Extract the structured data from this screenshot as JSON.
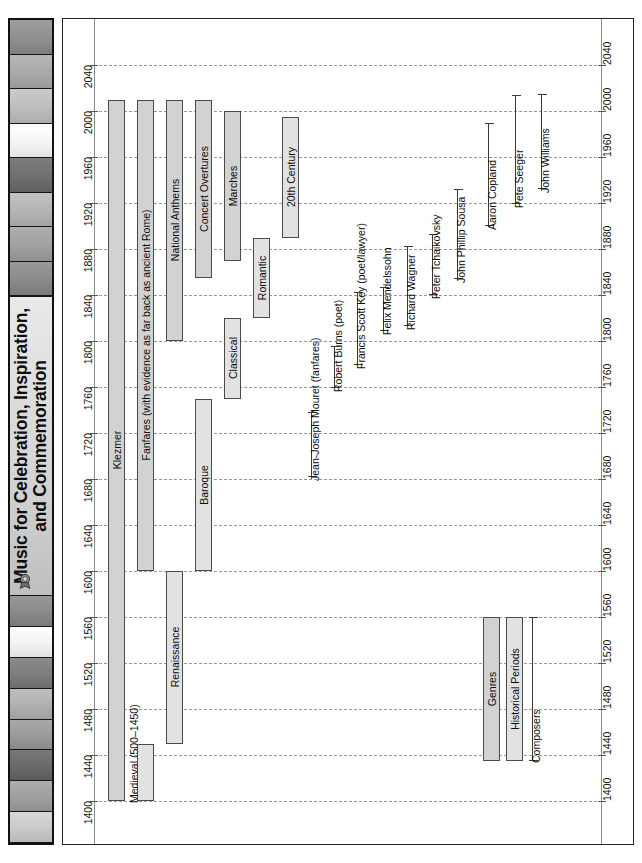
{
  "title": {
    "line1": "Music for Celebration, Inspiration,",
    "line2": "and Commemoration",
    "badge_icon": "ribbon-seal-icon"
  },
  "sidebar": {
    "swatches": [
      {
        "name": "swatch-1"
      },
      {
        "name": "swatch-2"
      },
      {
        "name": "swatch-3"
      },
      {
        "name": "swatch-4"
      },
      {
        "name": "swatch-5"
      },
      {
        "name": "swatch-6"
      },
      {
        "name": "swatch-7"
      },
      {
        "name": "swatch-8"
      },
      {
        "name": "swatch-9"
      },
      {
        "name": "swatch-10"
      },
      {
        "name": "swatch-11"
      },
      {
        "name": "swatch-12"
      },
      {
        "name": "swatch-13"
      },
      {
        "name": "swatch-14"
      },
      {
        "name": "swatch-15"
      },
      {
        "name": "swatch-16"
      }
    ]
  },
  "colors": {
    "genre_fill": "#d2d2d2",
    "period_fill": "#e2e2e2",
    "bar_stroke": "#4a4a4a",
    "gridline": "#9a9a9a",
    "axis": "#8c8c8c",
    "frame": "#222222",
    "text": "#0d0d0d"
  },
  "chart_data": {
    "type": "bar",
    "orientation": "vertical-timeline",
    "title": "Music for Celebration, Inspiration, and Commemoration",
    "xlabel": "",
    "ylabel": "",
    "ylim": [
      1400,
      2040
    ],
    "ytick_step": 40,
    "grid": true,
    "tick_labels": [
      "1400",
      "1440",
      "1480",
      "1520",
      "1560",
      "1600",
      "1640",
      "1680",
      "1720",
      "1760",
      "1800",
      "1840",
      "1880",
      "1920",
      "1960",
      "2000",
      "2040"
    ],
    "legend": {
      "position": "bottom-right-inside",
      "entries": [
        {
          "label": "Genres",
          "kind": "bar",
          "color": "#d2d2d2"
        },
        {
          "label": "Historical Periods",
          "kind": "bar",
          "color": "#e2e2e2"
        },
        {
          "label": "Composers",
          "kind": "range-line",
          "color": "#3a3a3a"
        }
      ]
    },
    "series": [
      {
        "name": "Genres",
        "kind": "bar",
        "style": "genre",
        "items": [
          {
            "label": "Klezmer",
            "start": 1400,
            "end": 2010
          },
          {
            "label": "Fanfares (with evidence as far back as ancient Rome)",
            "start": 1600,
            "end": 2010
          },
          {
            "label": "National Anthems",
            "start": 1800,
            "end": 2010
          },
          {
            "label": "Concert Overtures",
            "start": 1855,
            "end": 2010
          },
          {
            "label": "Marches",
            "start": 1870,
            "end": 2000
          }
        ]
      },
      {
        "name": "Historical Periods",
        "kind": "bar",
        "style": "period",
        "items": [
          {
            "label": "Medieval (500–1450)",
            "start": 1400,
            "end": 1450
          },
          {
            "label": "Renaissance",
            "start": 1450,
            "end": 1600
          },
          {
            "label": "Baroque",
            "start": 1600,
            "end": 1750
          },
          {
            "label": "Classical",
            "start": 1750,
            "end": 1820
          },
          {
            "label": "Romantic",
            "start": 1820,
            "end": 1890
          },
          {
            "label": "20th Century",
            "start": 1890,
            "end": 1995
          }
        ]
      },
      {
        "name": "Composers",
        "kind": "range-line",
        "items": [
          {
            "label": "Jean-Joseph Mouret (fanfares)",
            "start": 1682,
            "end": 1738
          },
          {
            "label": "Robert Burns (poet)",
            "start": 1759,
            "end": 1796
          },
          {
            "label": "Francis Scott Key (poet/lawyer)",
            "start": 1779,
            "end": 1843
          },
          {
            "label": "Felix Mendelssohn",
            "start": 1809,
            "end": 1847
          },
          {
            "label": "Richard Wagner",
            "start": 1813,
            "end": 1883
          },
          {
            "label": "Peter Tchaikovsky",
            "start": 1840,
            "end": 1893
          },
          {
            "label": "John Phillip Sousa",
            "start": 1854,
            "end": 1932
          },
          {
            "label": "Aaron Copland",
            "start": 1900,
            "end": 1990
          },
          {
            "label": "Pete Seeger",
            "start": 1919,
            "end": 2014
          },
          {
            "label": "John Williams",
            "start": 1932,
            "end": 2015
          }
        ]
      }
    ],
    "legend_items_plot": [
      {
        "label": "Genres",
        "start": 1435,
        "end": 1560,
        "style": "genre"
      },
      {
        "label": "Historical Periods",
        "start": 1435,
        "end": 1560,
        "style": "period"
      },
      {
        "label": "Composers",
        "start": 1435,
        "end": 1560,
        "style": "range"
      }
    ]
  }
}
